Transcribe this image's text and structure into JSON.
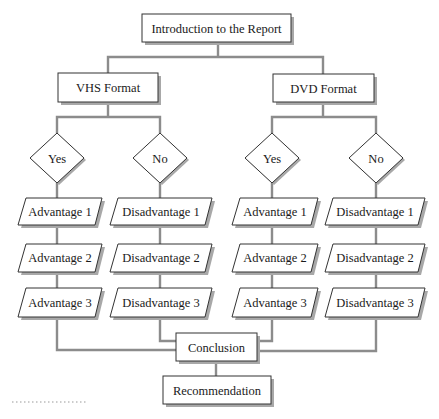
{
  "diagram": {
    "root": {
      "label": "Introduction to the Report"
    },
    "branches": [
      {
        "label": "VHS Format",
        "decisions": [
          {
            "label": "Yes",
            "items": [
              "Advantage 1",
              "Advantage 2",
              "Advantage 3"
            ]
          },
          {
            "label": "No",
            "items": [
              "Disadvantage 1",
              "Disadvantage 2",
              "Disadvantage 3"
            ]
          }
        ]
      },
      {
        "label": "DVD Format",
        "decisions": [
          {
            "label": "Yes",
            "items": [
              "Advantage 1",
              "Advantage 2",
              "Advantage 3"
            ]
          },
          {
            "label": "No",
            "items": [
              "Disadvantage 1",
              "Disadvantage 2",
              "Disadvantage 3"
            ]
          }
        ]
      }
    ],
    "conclusion": {
      "label": "Conclusion"
    },
    "recommendation": {
      "label": "Recommendation"
    }
  },
  "colors": {
    "connector": "#8c8c8c",
    "border": "#333333",
    "shadow": "#a8a8a8",
    "fill": "#ffffff"
  }
}
